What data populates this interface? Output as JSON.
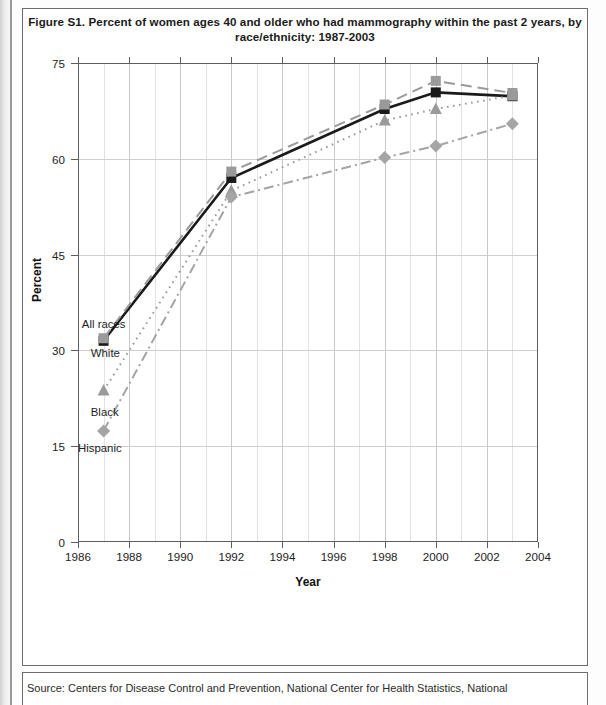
{
  "figure": {
    "title": "Figure S1. Percent of women ages 40 and older who had mammography within the past 2 years, by race/ethnicity: 1987-2003",
    "source": "Source: Centers for Disease Control and Prevention, National Center for Health Statistics, National"
  },
  "axis": {
    "x_title": "Year",
    "y_title": "Percent",
    "x_ticks": [
      "1986",
      "1988",
      "1990",
      "1992",
      "1994",
      "1996",
      "1998",
      "2000",
      "2002",
      "2004"
    ],
    "y_ticks": [
      "0",
      "15",
      "30",
      "45",
      "60",
      "75"
    ]
  },
  "inline_labels": {
    "all_races": "All races",
    "white": "White",
    "black": "Black",
    "hispanic": "Hispanic"
  },
  "colors": {
    "all_races": "#1a1a1a",
    "white": "#9a9a9a",
    "black": "#9a9a9a",
    "hispanic": "#a5a5a5",
    "grid": "#cfcfcf",
    "axis": "#5d5d5d",
    "frame": "#6d6d6d"
  },
  "chart_data": {
    "type": "line",
    "title": "Figure S1. Percent of women ages 40 and older who had mammography within the past 2 years, by race/ethnicity: 1987-2003",
    "xlabel": "Year",
    "ylabel": "Percent",
    "xlim": [
      1986,
      2004
    ],
    "ylim": [
      0,
      75
    ],
    "yticks": [
      0,
      15,
      30,
      45,
      60,
      75
    ],
    "xticks": [
      1986,
      1988,
      1990,
      1992,
      1994,
      1996,
      1998,
      2000,
      2002,
      2004
    ],
    "grid": true,
    "legend": "inline-labels-at-1987",
    "x": [
      1987,
      1992,
      1998,
      2000,
      2003
    ],
    "series": [
      {
        "name": "All races",
        "marker": "square",
        "line_style": "solid",
        "color": "#1a1a1a",
        "values": [
          31.5,
          57.0,
          67.8,
          70.4,
          69.8
        ]
      },
      {
        "name": "White",
        "marker": "square",
        "line_style": "long-dash",
        "color": "#9a9a9a",
        "values": [
          31.9,
          58.0,
          68.5,
          72.2,
          70.3
        ]
      },
      {
        "name": "Black",
        "marker": "triangle",
        "line_style": "dotted",
        "color": "#9a9a9a",
        "values": [
          23.7,
          55.0,
          66.0,
          67.8,
          69.9
        ]
      },
      {
        "name": "Hispanic",
        "marker": "diamond",
        "line_style": "dash-dot",
        "color": "#a5a5a5",
        "values": [
          17.4,
          54.0,
          60.2,
          62.0,
          65.5
        ]
      }
    ]
  }
}
